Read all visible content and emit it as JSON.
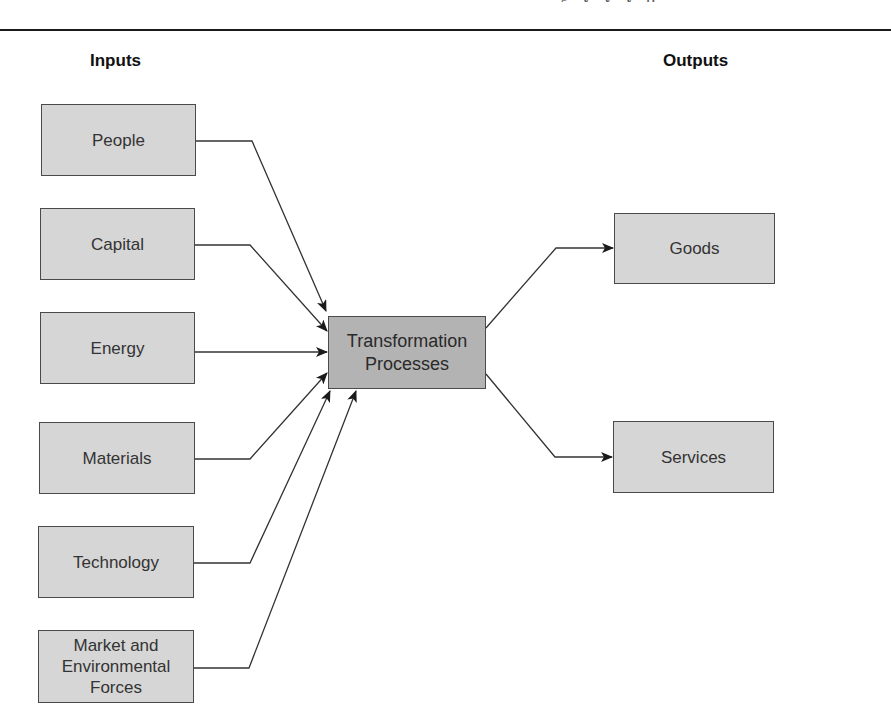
{
  "diagram": {
    "type": "input-process-output flow",
    "headers": {
      "inputs": "Inputs",
      "outputs": "Outputs"
    },
    "inputs": [
      {
        "id": "people",
        "label": "People"
      },
      {
        "id": "capital",
        "label": "Capital"
      },
      {
        "id": "energy",
        "label": "Energy"
      },
      {
        "id": "materials",
        "label": "Materials"
      },
      {
        "id": "technology",
        "label": "Technology"
      },
      {
        "id": "market",
        "label": "Market and\nEnvironmental\nForces"
      }
    ],
    "process": {
      "id": "transformation",
      "label": "Transformation\nProcesses"
    },
    "outputs": [
      {
        "id": "goods",
        "label": "Goods"
      },
      {
        "id": "services",
        "label": "Services"
      }
    ],
    "edges": [
      {
        "from": "people",
        "to": "transformation"
      },
      {
        "from": "capital",
        "to": "transformation"
      },
      {
        "from": "energy",
        "to": "transformation"
      },
      {
        "from": "materials",
        "to": "transformation"
      },
      {
        "from": "technology",
        "to": "transformation"
      },
      {
        "from": "market",
        "to": "transformation"
      },
      {
        "from": "transformation",
        "to": "goods"
      },
      {
        "from": "transformation",
        "to": "services"
      }
    ],
    "colors": {
      "input_fill": "#d6d6d6",
      "process_fill": "#b3b3b3",
      "output_fill": "#d6d6d6",
      "border": "#4a4a4a",
      "line": "#333333",
      "rule": "#1a1a1a"
    }
  }
}
